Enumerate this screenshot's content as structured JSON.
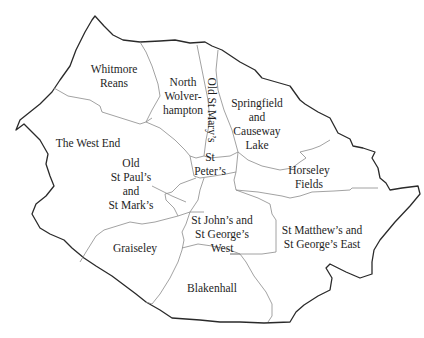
{
  "map": {
    "title": "Wolverhampton wards",
    "wards": [
      {
        "id": "whitmore-reans",
        "label": "Whitmore\nReans"
      },
      {
        "id": "north-wolverhampton",
        "label": "North\nWolver-\nhampton"
      },
      {
        "id": "old-st-marys",
        "label": "Old St Mary’s"
      },
      {
        "id": "springfield-causeway-lake",
        "label": "Springfield\nand\nCauseway\nLake"
      },
      {
        "id": "the-west-end",
        "label": "The West End"
      },
      {
        "id": "st-peters",
        "label": "St\nPeter’s"
      },
      {
        "id": "horseley-fields",
        "label": "Horseley\nFields"
      },
      {
        "id": "old-st-pauls-st-marks",
        "label": "Old\nSt Paul’s\nand\nSt Mark’s"
      },
      {
        "id": "st-johns-st-georges-west",
        "label": "St John’s and\nSt George’s\nWest"
      },
      {
        "id": "st-matthews-st-georges-east",
        "label": "St Matthew’s and\nSt George’s East"
      },
      {
        "id": "graiseley",
        "label": "Graiseley"
      },
      {
        "id": "blakenhall",
        "label": "Blakenhall"
      }
    ]
  }
}
